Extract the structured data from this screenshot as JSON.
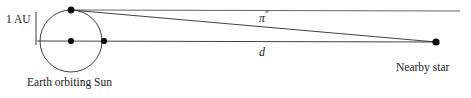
{
  "diagram": {
    "type": "astronomy-diagram",
    "canvas": {
      "width": 471,
      "height": 98,
      "background": "#ffffff"
    },
    "stroke_color": "#1a1a1a",
    "labels": {
      "au": "1 AU",
      "earth_orbit": "Earth orbiting Sun",
      "nearby_star": "Nearby star",
      "parallax_symbol": "π",
      "parallax_prime": "″",
      "distance": "d"
    },
    "geometry": {
      "orbit": {
        "cx": 71,
        "cy": 41,
        "r": 31
      },
      "sun_dot": {
        "x": 71,
        "y": 41,
        "r": 3.1
      },
      "earth_dot_top": {
        "x": 71,
        "y": 10,
        "r": 3.4
      },
      "earth_dot_right": {
        "x": 104,
        "y": 41,
        "r": 3.1
      },
      "star_dot": {
        "x": 436,
        "y": 42,
        "r": 3.6
      },
      "reference_line": {
        "x1": 71,
        "y1": 10,
        "x2": 460,
        "y2": 11
      },
      "sight_line": {
        "x1": 71,
        "y1": 10,
        "x2": 436,
        "y2": 42
      },
      "baseline": {
        "x1": 37,
        "y1": 41,
        "x2": 436,
        "y2": 42
      },
      "au_tick": {
        "x": 36,
        "y1": 12,
        "y2": 45
      }
    }
  }
}
